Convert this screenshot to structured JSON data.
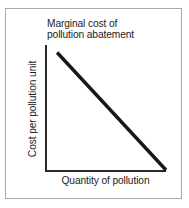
{
  "figure": {
    "background_color": "#ffffff",
    "border_color": "#a9a9a9",
    "axis_color": "#2a2a2a",
    "line_color": "#181818",
    "text_color": "#1b1b1b"
  },
  "chart_data": {
    "type": "line",
    "title": "Marginal cost of\npollution abatement",
    "title_line_1": "Marginal cost of",
    "title_line_2": "pollution abatement",
    "xlabel": "Quantity of pollution",
    "ylabel": "Cost per pollution unit",
    "grid": false,
    "legend": "none",
    "xlim": [
      0,
      1
    ],
    "ylim": [
      0,
      1
    ],
    "xticks": [],
    "yticks": [],
    "series": [
      {
        "name": "Marginal cost of pollution abatement",
        "color": "#181818",
        "linewidth": 3,
        "x": [
          0.1,
          1.0
        ],
        "y": [
          0.94,
          0.0
        ],
        "points": [
          {
            "x": 0.1,
            "y": 0.94
          },
          {
            "x": 1.0,
            "y": 0.0
          }
        ]
      }
    ],
    "annotations": [
      {
        "text": "Marginal cost of pollution abatement",
        "target": "curve",
        "position": "above-left"
      }
    ]
  }
}
